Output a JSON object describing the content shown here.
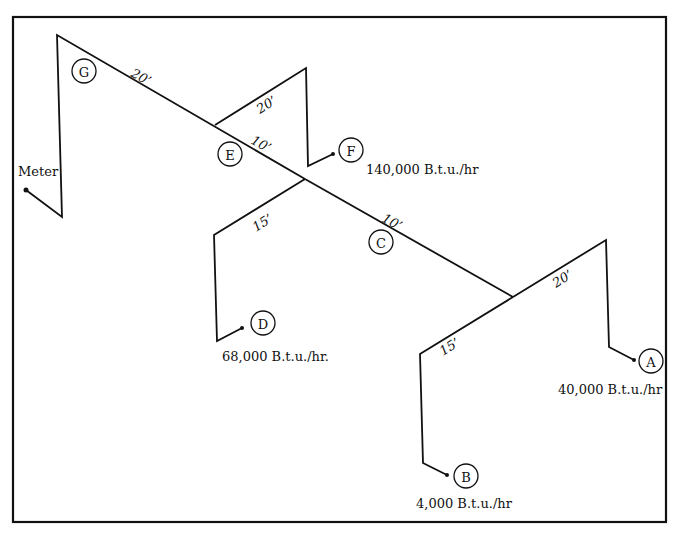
{
  "diagram": {
    "meter": {
      "label": "Meter"
    },
    "nodes": [
      {
        "id": "G",
        "label": "G"
      },
      {
        "id": "E",
        "label": "E"
      },
      {
        "id": "F",
        "label": "F"
      },
      {
        "id": "C",
        "label": "C"
      },
      {
        "id": "D",
        "label": "D"
      },
      {
        "id": "A",
        "label": "A"
      },
      {
        "id": "B",
        "label": "B"
      }
    ],
    "segment_lengths": {
      "meter_to_E": "20’",
      "E_to_F": "20’",
      "E_to_C": "10’",
      "junction_to_D": "15’",
      "C_to_junction": "10’",
      "junction_to_A": "20’",
      "junction_to_B": "15’"
    },
    "loads": {
      "F": "140,000 B.t.u./hr",
      "D": "68,000 B.t.u./hr.",
      "A": "40,000 B.t.u./hr",
      "B": "4,000 B.t.u./hr"
    }
  }
}
